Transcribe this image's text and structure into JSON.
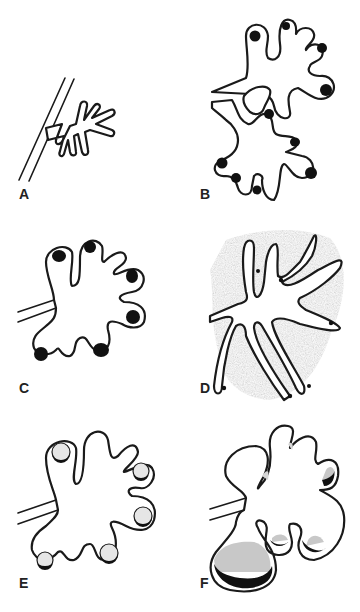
{
  "figure": {
    "panels": [
      {
        "id": "A",
        "label": "A",
        "description": "Small branching gland with narrow tubular acini off a straight duct"
      },
      {
        "id": "B",
        "label": "B",
        "description": "Two lobulated acinar clusters with dark dots in each terminal bulb"
      },
      {
        "id": "C",
        "label": "C",
        "description": "Single lobulated acinus with dark nodules in distal bulbs"
      },
      {
        "id": "D",
        "label": "D",
        "description": "Elongated branching tubules surrounded by shaded stroma with small dots"
      },
      {
        "id": "E",
        "label": "E",
        "description": "Lobulated acinus with pale rounded bodies having dark crescents"
      },
      {
        "id": "F",
        "label": "F",
        "description": "Dilated cystic lobules with grey contents and dark crescent deposits"
      }
    ]
  },
  "colors": {
    "line": "#1a1a1a",
    "fill_dark": "#111111",
    "fill_grey": "#c8c8c8",
    "stroma": "#b0b0b0",
    "background": "#ffffff"
  }
}
